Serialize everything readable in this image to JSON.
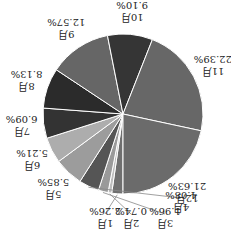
{
  "chart_data": {
    "type": "pie",
    "title": "",
    "orientation": "rotated 180 degrees",
    "start": "12 o'clock (before rotation), clockwise",
    "categories": [
      "1月",
      "2月",
      "3月",
      "4月",
      "5月",
      "6月",
      "7月",
      "8月",
      "9月",
      "10月",
      "11月",
      "12月"
    ],
    "values": [
      2.26,
      0.74,
      1.96,
      4.08,
      5.85,
      5.21,
      6.09,
      8.13,
      12.57,
      9.1,
      22.39,
      21.63
    ],
    "value_labels": [
      "2.26%",
      "0.74%",
      "1.96%",
      "4.08%",
      "5.85%",
      "5.21%",
      "6.09%",
      "8.13%",
      "12.57%",
      "9.10%",
      "22.39%",
      "21.63%"
    ],
    "colors": [
      "#6f6f6f",
      "#bdbdbd",
      "#9a9a9a",
      "#555555",
      "#9c9c9c",
      "#adadad",
      "#333333",
      "#2b2b2b",
      "#666666",
      "#353535",
      "#676767",
      "#6b6b6b"
    ],
    "legend": "none"
  }
}
